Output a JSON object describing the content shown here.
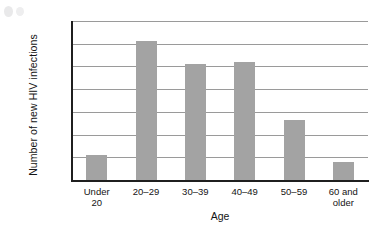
{
  "chart_data": {
    "type": "bar",
    "title": "",
    "xlabel": "Age",
    "ylabel": "Number of new HIV infections",
    "categories": [
      "Under 20",
      "20–29",
      "30–39",
      "40–49",
      "50–59",
      "60 and older"
    ],
    "category_lines": [
      [
        "Under",
        "20"
      ],
      [
        "20–29"
      ],
      [
        "30–39"
      ],
      [
        "40–49"
      ],
      [
        "50–59"
      ],
      [
        "60 and",
        "older"
      ]
    ],
    "values": [
      2200,
      12200,
      10250,
      10400,
      5300,
      1600
    ],
    "ylim": [
      0,
      14000
    ],
    "ytick_step": 2000,
    "ytick_labels": [
      "0",
      "2,000",
      "4,000",
      "6,000",
      "8,000",
      "10,000",
      "12,000",
      "14,000"
    ],
    "ytick_values": [
      0,
      2000,
      4000,
      6000,
      8000,
      10000,
      12000,
      14000
    ],
    "grid": true,
    "legend": "none",
    "bar_color": "#a3a3a3",
    "grid_color": "#9a9a9a",
    "axis_color": "#1f1f1f"
  }
}
